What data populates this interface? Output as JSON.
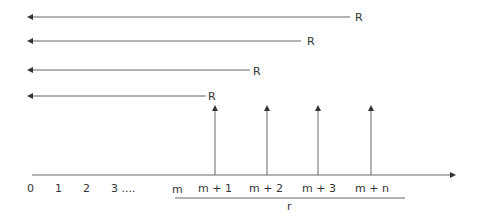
{
  "diagram": {
    "type": "cash-flow timeline",
    "colors": {
      "line": "#555555",
      "text": "#333333"
    },
    "left_arrows": [
      {
        "label": "R",
        "y": 17,
        "x_start": 350,
        "x_end": 28,
        "label_x": 356
      },
      {
        "label": "R",
        "y": 41,
        "x_start": 301,
        "x_end": 28,
        "label_x": 308
      },
      {
        "label": "R",
        "y": 70,
        "x_start": 250,
        "x_end": 28,
        "label_x": 254
      },
      {
        "label": "R",
        "y": 96,
        "x_start": 206,
        "x_end": 28,
        "label_x": 209
      }
    ],
    "up_arrows": [
      {
        "x": 215,
        "at": "m + 1"
      },
      {
        "x": 267,
        "at": "m + 2"
      },
      {
        "x": 318,
        "at": "m + 3"
      },
      {
        "x": 371,
        "at": "m + n"
      }
    ],
    "axis_labels": [
      {
        "text": "0",
        "x": 30
      },
      {
        "text": "1",
        "x": 58
      },
      {
        "text": "2",
        "x": 86
      },
      {
        "text": "3 ....",
        "x": 113
      },
      {
        "text": "m",
        "x": 174
      },
      {
        "text": "m + 1",
        "x": 199
      },
      {
        "text": "m + 2",
        "x": 250
      },
      {
        "text": "m + 3",
        "x": 303
      },
      {
        "text": "m + n",
        "x": 356
      }
    ],
    "brace_label": "r"
  }
}
